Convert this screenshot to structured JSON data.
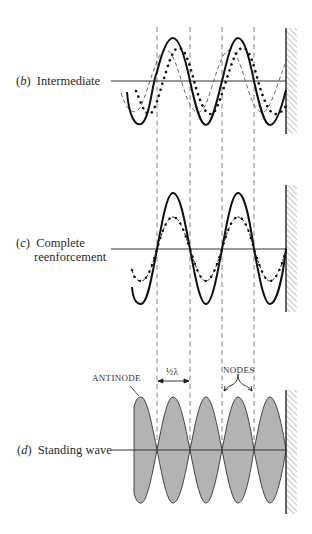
{
  "figure": {
    "panels": [
      {
        "id": "b",
        "letter": "b",
        "title": "Intermediate"
      },
      {
        "id": "c",
        "letter": "c",
        "title_line1": "Complete",
        "title_line2": "reenforcement"
      },
      {
        "id": "d",
        "letter": "d",
        "title": "Standing wave"
      }
    ],
    "annotations": {
      "antinode": "ANTINODE",
      "nodes": "NODES",
      "half_wavelength": "½λ"
    },
    "colors": {
      "line": "#1a1a1a",
      "dashed": "#555555",
      "lobe_fill": "#b3b3b3",
      "wall_hatch": "#888888"
    }
  }
}
